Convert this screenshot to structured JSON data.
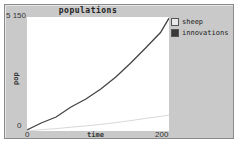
{
  "chart_data": {
    "type": "line",
    "title": "populations",
    "xlabel": "time",
    "ylabel": "pop",
    "xlim": [
      0,
      200
    ],
    "ylim": [
      0,
      5150
    ],
    "x_ticks": [
      "0",
      "200"
    ],
    "y_ticks": [
      "0",
      "5 150"
    ],
    "grid": false,
    "legend_position": "right",
    "series": [
      {
        "name": "sheep",
        "color": "#d8d8d8",
        "x": [
          0,
          20,
          41,
          62,
          83,
          104,
          125,
          146,
          167,
          188,
          200
        ],
        "y": [
          0,
          60,
          110,
          170,
          230,
          300,
          380,
          470,
          570,
          660,
          720
        ]
      },
      {
        "name": "innovations",
        "color": "#444444",
        "x": [
          0,
          20,
          41,
          62,
          83,
          104,
          125,
          146,
          167,
          188,
          200
        ],
        "y": [
          45,
          361,
          633,
          1084,
          1446,
          1898,
          2440,
          3072,
          3750,
          4450,
          5100
        ]
      }
    ]
  },
  "plot": {
    "title": "populations",
    "x_axis": {
      "label": "time",
      "min_label": "0",
      "max_label": "200"
    },
    "y_axis": {
      "label": "pop",
      "min_label": "0",
      "max_label": "5 150"
    }
  },
  "legend": [
    {
      "label": "sheep",
      "swatch": "#e8e8e8"
    },
    {
      "label": "innovations",
      "swatch": "#3a3a3a"
    }
  ]
}
